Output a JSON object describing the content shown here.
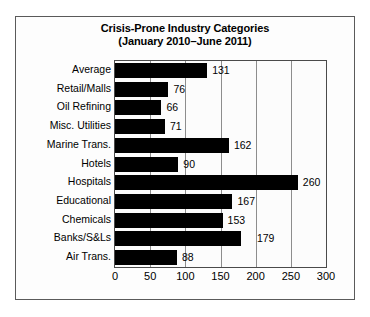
{
  "chart_data": {
    "type": "bar",
    "orientation": "horizontal",
    "title": "Crisis-Prone Industry Categories",
    "subtitle": "(January 2010–June 2011)",
    "xlabel": "",
    "ylabel": "",
    "xlim": [
      0,
      300
    ],
    "xticks": [
      "0",
      "50",
      "100",
      "150",
      "200",
      "250",
      "300"
    ],
    "xtick_values": [
      0,
      50,
      100,
      150,
      200,
      250,
      300
    ],
    "grid": "vertical",
    "legend": "none",
    "bar_color": "#000000",
    "categories": [
      "Average",
      "Retail/Malls",
      "Oil Refining",
      "Misc. Utilities",
      "Marine Trans.",
      "Hotels",
      "Hospitals",
      "Educational",
      "Chemicals",
      "Banks/S&Ls",
      "Air Trans."
    ],
    "values": [
      131,
      76,
      66,
      71,
      162,
      90,
      260,
      167,
      153,
      179,
      88
    ],
    "data_labels": [
      "131",
      "76",
      "66",
      "71",
      "162",
      "90",
      "260",
      "167",
      "153",
      "179",
      "88"
    ]
  },
  "figure": {
    "background": "#fdfdfd",
    "border_color": "#5a5a5a",
    "gridline_color": "#8d8d8d"
  }
}
